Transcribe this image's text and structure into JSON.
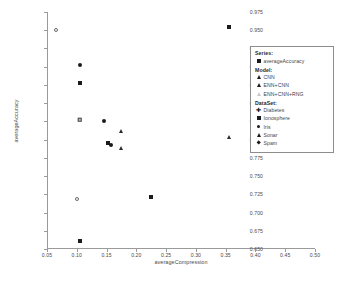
{
  "chart_data": {
    "type": "scatter",
    "title": "",
    "xlabel": "averageCompression",
    "ylabel": "averageAccuracy",
    "xlim": [
      0.05,
      0.5
    ],
    "ylim": [
      0.65,
      0.975
    ],
    "grid": false,
    "xticks": [
      "0.05",
      "0.10",
      "0.15",
      "0.20",
      "0.25",
      "0.30",
      "0.35",
      "0.40",
      "0.45",
      "0.50"
    ],
    "xtick_values": [
      0.05,
      0.1,
      0.15,
      0.2,
      0.25,
      0.3,
      0.35,
      0.4,
      0.45,
      0.5
    ],
    "yticks": [
      "0.975",
      "0.950",
      "0.925",
      "0.900",
      "0.875",
      "0.850",
      "0.825",
      "0.800",
      "0.775",
      "0.750",
      "0.725",
      "0.700",
      "0.675",
      "0.650"
    ],
    "ytick_values": [
      0.975,
      0.95,
      0.925,
      0.9,
      0.875,
      0.85,
      0.825,
      0.8,
      0.775,
      0.75,
      0.725,
      0.7,
      0.675,
      0.65
    ],
    "points": [
      {
        "x": 0.065,
        "y": 0.951,
        "marker": "circle-open"
      },
      {
        "x": 0.105,
        "y": 0.902,
        "marker": "circle-filled"
      },
      {
        "x": 0.105,
        "y": 0.877,
        "marker": "square-filled"
      },
      {
        "x": 0.105,
        "y": 0.827,
        "marker": "square-dotted"
      },
      {
        "x": 0.1,
        "y": 0.718,
        "marker": "circle-open"
      },
      {
        "x": 0.105,
        "y": 0.661,
        "marker": "square-filled"
      },
      {
        "x": 0.145,
        "y": 0.825,
        "marker": "circle-filled"
      },
      {
        "x": 0.152,
        "y": 0.795,
        "marker": "square-filled"
      },
      {
        "x": 0.158,
        "y": 0.792,
        "marker": "circle-filled"
      },
      {
        "x": 0.175,
        "y": 0.812,
        "marker": "triangle"
      },
      {
        "x": 0.175,
        "y": 0.789,
        "marker": "triangle"
      },
      {
        "x": 0.225,
        "y": 0.721,
        "marker": "square-filled"
      },
      {
        "x": 0.355,
        "y": 0.955,
        "marker": "square-filled"
      },
      {
        "x": 0.355,
        "y": 0.803,
        "marker": "triangle"
      }
    ],
    "legend_position": "upper right",
    "legend": {
      "groups": [
        {
          "heading": "Series:",
          "entries": [
            {
              "label": "averageAccuracy",
              "marker": "square-filled"
            }
          ]
        },
        {
          "heading": "Model:",
          "entries": [
            {
              "label": "CNN",
              "marker": "triangle-filled"
            },
            {
              "label": "ENN+CNN",
              "marker": "triangle-filled"
            },
            {
              "label": "ENN+CNN+RNG",
              "marker": "triangle-open"
            }
          ]
        },
        {
          "heading": "DataSet:",
          "entries": [
            {
              "label": "Diabetes",
              "marker": "cross"
            },
            {
              "label": "Ionosphere",
              "marker": "square-filled"
            },
            {
              "label": "Iris",
              "marker": "circle-filled"
            },
            {
              "label": "Sonar",
              "marker": "triangle-filled"
            },
            {
              "label": "Spam",
              "marker": "diamond-filled"
            }
          ]
        }
      ]
    }
  }
}
